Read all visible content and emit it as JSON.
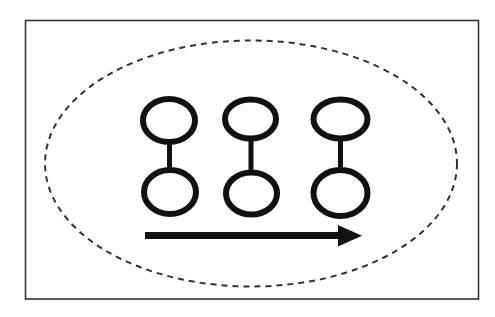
{
  "diagram": {
    "colors": {
      "background": "#ffffff",
      "frame_stroke": "#333333",
      "ellipse_stroke": "#333333",
      "shape_stroke": "#111111",
      "arrow_fill": "#111111"
    },
    "frame": {
      "x": 25.5,
      "y": 20.5,
      "width": 453,
      "height": 278.5,
      "stroke_width": 1.6
    },
    "boundary_ellipse": {
      "cx": 251,
      "cy": 163.5,
      "rx": 206,
      "ry": 123,
      "stroke_width": 2,
      "dash": "6 5"
    },
    "dumbbells": [
      {
        "id": "dumbbell-1",
        "top": {
          "cx": 169,
          "cy": 120.5,
          "rx": 26,
          "ry": 21.5
        },
        "bottom": {
          "cx": 170,
          "cy": 192,
          "rx": 26,
          "ry": 22
        },
        "connector": {
          "x": 169.5,
          "y1": 142,
          "y2": 170
        }
      },
      {
        "id": "dumbbell-2",
        "top": {
          "cx": 250.5,
          "cy": 119,
          "rx": 25.5,
          "ry": 19.5
        },
        "bottom": {
          "cx": 251.5,
          "cy": 193.5,
          "rx": 25.5,
          "ry": 21
        },
        "connector": {
          "x": 251,
          "y1": 139,
          "y2": 172
        }
      },
      {
        "id": "dumbbell-3",
        "top": {
          "cx": 340.5,
          "cy": 119,
          "rx": 27,
          "ry": 19.5
        },
        "bottom": {
          "cx": 340.5,
          "cy": 193,
          "rx": 27,
          "ry": 23
        },
        "connector": {
          "x": 340.5,
          "y1": 139,
          "y2": 170
        }
      }
    ],
    "circle_stroke_width": 6,
    "connector_stroke_width": 5,
    "arrow": {
      "direction": "right",
      "shaft": {
        "x1": 145,
        "x2": 340,
        "y": 235.5,
        "thickness": 7
      },
      "head": {
        "base_x": 338,
        "tip_x": 362,
        "top_y": 225,
        "bottom_y": 246.5,
        "tip_y": 235.8
      }
    }
  }
}
